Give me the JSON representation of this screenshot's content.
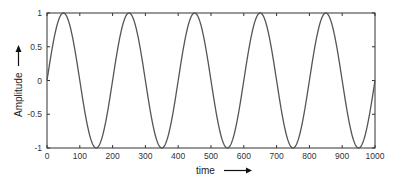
{
  "chart_data": {
    "type": "line",
    "title": "",
    "xlabel": "time",
    "ylabel": "Amplitude",
    "xlim": [
      0,
      1000
    ],
    "ylim": [
      -1,
      1
    ],
    "xticks": [
      0,
      100,
      200,
      300,
      400,
      500,
      600,
      700,
      800,
      900,
      1000
    ],
    "yticks": [
      -1,
      -0.5,
      0,
      0.5,
      1
    ],
    "xtick_labels": [
      "0",
      "100",
      "200",
      "300",
      "400",
      "500",
      "600",
      "700",
      "800",
      "900",
      "1000"
    ],
    "ytick_labels": [
      "-1",
      "-0.5",
      "0",
      "0.5",
      "1"
    ],
    "grid": false,
    "legend": null,
    "annotations": [
      "arrow after x-axis label pointing right",
      "arrow after y-axis label pointing up"
    ],
    "series": [
      {
        "name": "sine wave",
        "function": "sin(2*pi*t/200)",
        "period": 200,
        "amplitude": 1,
        "x": [
          0,
          50,
          100,
          150,
          200,
          250,
          300,
          350,
          400,
          450,
          500,
          550,
          600,
          650,
          700,
          750,
          800,
          850,
          900,
          950,
          1000
        ],
        "values": [
          0,
          1,
          0,
          -1,
          0,
          1,
          0,
          -1,
          0,
          1,
          0,
          -1,
          0,
          1,
          0,
          -1,
          0,
          1,
          0,
          -1,
          0
        ],
        "color": "#555555"
      }
    ]
  },
  "colors": {
    "line": "#555555",
    "axis": "#333333",
    "background": "#ffffff"
  }
}
